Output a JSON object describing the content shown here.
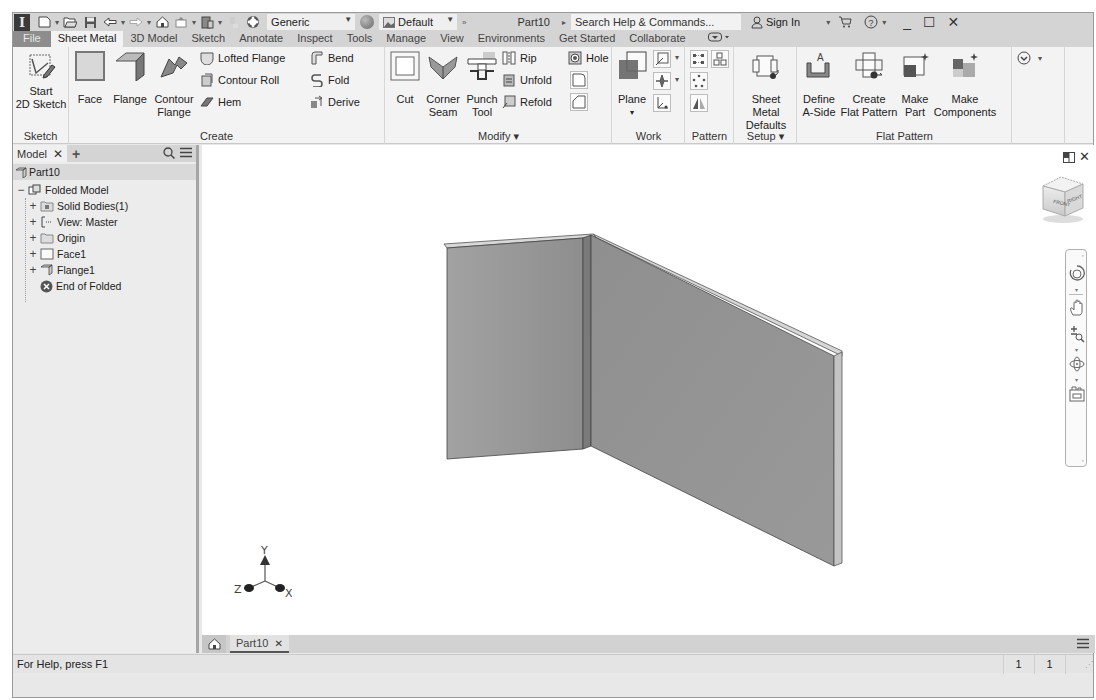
{
  "app": {
    "logo_letter": "I",
    "document_title": "Part10",
    "appearance_style": "Generic",
    "material": "Default",
    "search_placeholder": "Search Help & Commands...",
    "sign_in": "Sign In",
    "minimize": "_",
    "maximize": "☐",
    "close": "✕"
  },
  "tabs": [
    {
      "label": "File"
    },
    {
      "label": "Sheet Metal",
      "active": true
    },
    {
      "label": "3D Model"
    },
    {
      "label": "Sketch"
    },
    {
      "label": "Annotate"
    },
    {
      "label": "Inspect"
    },
    {
      "label": "Tools"
    },
    {
      "label": "Manage"
    },
    {
      "label": "View"
    },
    {
      "label": "Environments"
    },
    {
      "label": "Get Started"
    },
    {
      "label": "Collaborate"
    }
  ],
  "ribbon": {
    "sketch": {
      "title": "Sketch",
      "start_sketch_l1": "Start",
      "start_sketch_l2": "2D Sketch"
    },
    "create": {
      "title": "Create",
      "face": "Face",
      "flange": "Flange",
      "contour_flange_l1": "Contour",
      "contour_flange_l2": "Flange",
      "lofted_flange": "Lofted Flange",
      "contour_roll": "Contour Roll",
      "hem": "Hem",
      "bend": "Bend",
      "fold": "Fold",
      "derive": "Derive"
    },
    "modify": {
      "title": "Modify ▾",
      "cut": "Cut",
      "corner_seam_l1": "Corner",
      "corner_seam_l2": "Seam",
      "punch_tool_l1": "Punch",
      "punch_tool_l2": "Tool",
      "rip": "Rip",
      "unfold": "Unfold",
      "refold": "Refold",
      "hole": "Hole"
    },
    "work_features": {
      "title": "Work Features",
      "plane": "Plane"
    },
    "pattern": {
      "title": "Pattern"
    },
    "setup": {
      "title": "Setup ▾",
      "defaults_l1": "Sheet Metal",
      "defaults_l2": "Defaults"
    },
    "flat_pattern": {
      "title": "Flat Pattern",
      "define_l1": "Define",
      "define_l2": "A-Side",
      "create_l1": "Create",
      "create_l2": "Flat Pattern",
      "make_part_l1": "Make",
      "make_part_l2": "Part",
      "make_comp_l1": "Make",
      "make_comp_l2": "Components"
    }
  },
  "browser": {
    "tab_label": "Model",
    "add": "+",
    "root": "Part10",
    "items": [
      {
        "label": "Folded Model",
        "expander": "−",
        "indent": 0
      },
      {
        "label": "Solid Bodies(1)",
        "expander": "+",
        "indent": 1
      },
      {
        "label": "View: Master",
        "expander": "+",
        "indent": 1
      },
      {
        "label": "Origin",
        "expander": "+",
        "indent": 1
      },
      {
        "label": "Face1",
        "expander": "+",
        "indent": 1
      },
      {
        "label": "Flange1",
        "expander": "+",
        "indent": 1
      },
      {
        "label": "End of Folded",
        "expander": "",
        "indent": 1
      }
    ]
  },
  "viewport": {
    "viewcube_front": "FRONT",
    "viewcube_right": "RIGHT",
    "axis_x": "X",
    "axis_y": "Y",
    "axis_z": "Z"
  },
  "doc_tabs": {
    "active": "Part10",
    "close": "✕"
  },
  "status": {
    "help_text": "For Help, press F1",
    "count_1": "1",
    "count_2": "1"
  }
}
